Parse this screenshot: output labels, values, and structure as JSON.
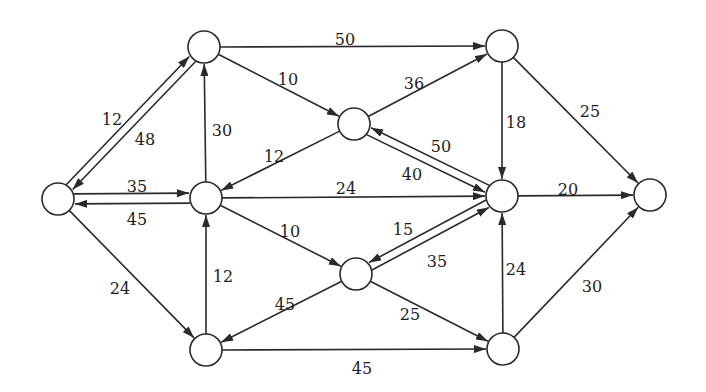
{
  "diagram": {
    "type": "directed-network",
    "node_radius": 16,
    "colors": {
      "stroke": "#2a2a2a",
      "fill": "#ffffff",
      "text": "#1e1e1e"
    },
    "nodes": [
      {
        "id": "A",
        "x": 58,
        "y": 199
      },
      {
        "id": "B",
        "x": 204,
        "y": 47
      },
      {
        "id": "C",
        "x": 502,
        "y": 46
      },
      {
        "id": "D",
        "x": 354,
        "y": 124
      },
      {
        "id": "E",
        "x": 206,
        "y": 198
      },
      {
        "id": "F",
        "x": 502,
        "y": 196
      },
      {
        "id": "G",
        "x": 650,
        "y": 195
      },
      {
        "id": "H",
        "x": 356,
        "y": 274
      },
      {
        "id": "I",
        "x": 206,
        "y": 350
      },
      {
        "id": "J",
        "x": 503,
        "y": 349
      }
    ],
    "edges": [
      {
        "from": "A",
        "to": "B",
        "weight": "12",
        "offset": -4,
        "lx": 112,
        "ly": 120
      },
      {
        "from": "B",
        "to": "A",
        "weight": "48",
        "offset": -4,
        "lx": 145,
        "ly": 140
      },
      {
        "from": "A",
        "to": "E",
        "weight": "35",
        "offset": -5,
        "lx": 137,
        "ly": 187
      },
      {
        "from": "E",
        "to": "A",
        "weight": "45",
        "offset": -5,
        "lx": 137,
        "ly": 220
      },
      {
        "from": "A",
        "to": "I",
        "weight": "24",
        "offset": 0,
        "lx": 120,
        "ly": 289
      },
      {
        "from": "B",
        "to": "C",
        "weight": "50",
        "offset": 0,
        "lx": 345,
        "ly": 40
      },
      {
        "from": "B",
        "to": "D",
        "weight": "10",
        "offset": 0,
        "lx": 288,
        "ly": 80
      },
      {
        "from": "E",
        "to": "B",
        "weight": "30",
        "offset": 0,
        "lx": 222,
        "ly": 131
      },
      {
        "from": "D",
        "to": "C",
        "weight": "36",
        "offset": 0,
        "lx": 414,
        "ly": 84
      },
      {
        "from": "D",
        "to": "E",
        "weight": "12",
        "offset": 0,
        "lx": 274,
        "ly": 157
      },
      {
        "from": "D",
        "to": "F",
        "weight": "50",
        "offset": 4,
        "lx": 441,
        "ly": 147
      },
      {
        "from": "F",
        "to": "D",
        "weight": "40",
        "offset": 4,
        "lx": 412,
        "ly": 175
      },
      {
        "from": "E",
        "to": "F",
        "weight": "24",
        "offset": 0,
        "lx": 346,
        "ly": 189
      },
      {
        "from": "E",
        "to": "H",
        "weight": "10",
        "offset": 0,
        "lx": 290,
        "ly": 232
      },
      {
        "from": "C",
        "to": "F",
        "weight": "18",
        "offset": 0,
        "lx": 516,
        "ly": 123
      },
      {
        "from": "C",
        "to": "G",
        "weight": "25",
        "offset": 0,
        "lx": 590,
        "ly": 112
      },
      {
        "from": "F",
        "to": "G",
        "weight": "20",
        "offset": 0,
        "lx": 568,
        "ly": 190
      },
      {
        "from": "H",
        "to": "F",
        "weight": "35",
        "offset": 4,
        "lx": 437,
        "ly": 262
      },
      {
        "from": "F",
        "to": "H",
        "weight": "15",
        "offset": 4,
        "lx": 403,
        "ly": 230
      },
      {
        "from": "H",
        "to": "I",
        "weight": "45",
        "offset": 0,
        "lx": 285,
        "ly": 305
      },
      {
        "from": "H",
        "to": "J",
        "weight": "25",
        "offset": 0,
        "lx": 410,
        "ly": 315
      },
      {
        "from": "I",
        "to": "E",
        "weight": "12",
        "offset": 0,
        "lx": 223,
        "ly": 277
      },
      {
        "from": "I",
        "to": "J",
        "weight": "45",
        "offset": 0,
        "lx": 362,
        "ly": 369
      },
      {
        "from": "J",
        "to": "F",
        "weight": "24",
        "offset": 0,
        "lx": 516,
        "ly": 270
      },
      {
        "from": "J",
        "to": "G",
        "weight": "30",
        "offset": 0,
        "lx": 592,
        "ly": 287
      }
    ]
  }
}
